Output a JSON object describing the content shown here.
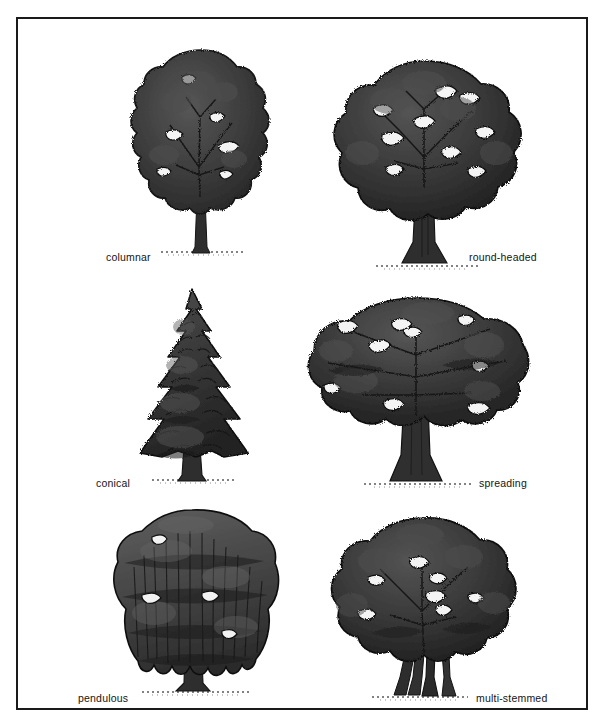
{
  "figure": {
    "kind": "botanical-illustration-plate",
    "background_color": "#ffffff",
    "border_color": "#1a1a1a",
    "ink_dark": "#2b2b2b",
    "ink_mid": "#4a4a4a",
    "ink_light": "#6a6a6a",
    "trunk_color": "#2e2e2e",
    "rows": 3,
    "columns": 2
  },
  "trees": [
    {
      "id": "columnar",
      "label": "columnar",
      "crown_shape": "tall narrow upright oval",
      "label_side": "left",
      "row": 1,
      "column": 1
    },
    {
      "id": "round-headed",
      "label": "round-headed",
      "crown_shape": "broad dome / circular canopy",
      "label_side": "right",
      "row": 1,
      "column": 2
    },
    {
      "id": "conical",
      "label": "conical",
      "crown_shape": "triangular conifer with tiered branches",
      "label_side": "left",
      "row": 2,
      "column": 1
    },
    {
      "id": "spreading",
      "label": "spreading",
      "crown_shape": "wide flat-topped horizontal canopy",
      "label_side": "right",
      "row": 2,
      "column": 2
    },
    {
      "id": "pendulous",
      "label": "pendulous",
      "crown_shape": "weeping draping curtain of branches",
      "label_side": "left",
      "row": 3,
      "column": 1
    },
    {
      "id": "multi-stemmed",
      "label": "multi-stemmed",
      "crown_shape": "round canopy over several rising trunks",
      "label_side": "right",
      "row": 3,
      "column": 2
    }
  ]
}
